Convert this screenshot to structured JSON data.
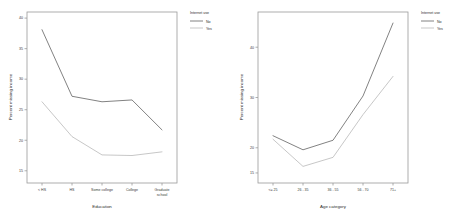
{
  "figure": {
    "background_color": "#ffffff",
    "axis_color": "#9a9a9a",
    "text_color": "#2b2b2b"
  },
  "legend": {
    "title": "Internet use",
    "items": [
      {
        "label": "No",
        "color": "#585858"
      },
      {
        "label": "Yes",
        "color": "#b4b4b4"
      }
    ]
  },
  "chart_data": [
    {
      "type": "line",
      "title": "",
      "xlabel": "Education",
      "ylabel": "Percent missing income",
      "categories": [
        "< HS",
        "HS",
        "Some college",
        "College",
        "Graduate school"
      ],
      "ylim": [
        13,
        41
      ],
      "yticks": [
        15,
        20,
        25,
        30,
        35,
        40
      ],
      "ytick_labels": [
        "15",
        "20",
        "25",
        "30",
        "35",
        "40"
      ],
      "grid": false,
      "legend_position": "right",
      "legend_title": "Internet use",
      "series": [
        {
          "name": "No",
          "color": "#585858",
          "values": [
            38.1,
            27.2,
            26.3,
            26.6,
            21.7
          ]
        },
        {
          "name": "Yes",
          "color": "#b4b4b4",
          "values": [
            26.3,
            20.6,
            17.6,
            17.5,
            18.1
          ]
        }
      ]
    },
    {
      "type": "line",
      "title": "",
      "xlabel": "Age category",
      "ylabel": "Percent missing income",
      "categories": [
        "<= 25",
        "26 - 35",
        "36 - 55",
        "56 - 70",
        "71+"
      ],
      "ylim": [
        13,
        47
      ],
      "yticks": [
        15,
        20,
        30,
        40
      ],
      "ytick_labels": [
        "15",
        "20",
        "30",
        "40"
      ],
      "grid": false,
      "legend_position": "right",
      "legend_title": "Internet use",
      "series": [
        {
          "name": "No",
          "color": "#585858",
          "values": [
            22.4,
            19.6,
            21.5,
            30.3,
            44.8
          ]
        },
        {
          "name": "Yes",
          "color": "#b4b4b4",
          "values": [
            21.7,
            16.3,
            18.1,
            26.6,
            34.2
          ]
        }
      ]
    }
  ]
}
